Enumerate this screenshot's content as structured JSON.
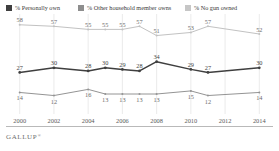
{
  "legend": {
    "items": [
      {
        "label": "% Personally own",
        "color": "#3f3f3f",
        "icon": "square-swatch-icon"
      },
      {
        "label": "% Other household member owns",
        "color": "#8e8e8e",
        "icon": "square-swatch-icon"
      },
      {
        "label": "% No gun owned",
        "color": "#c6c6c6",
        "icon": "square-swatch-icon"
      }
    ]
  },
  "footer": {
    "wordmark": "GALLUP",
    "trademark": "®"
  },
  "chart_data": {
    "type": "line",
    "title": "",
    "subtitle": "",
    "xlabel": "",
    "ylabel": "",
    "grid": true,
    "legend_position": "top",
    "x": [
      2000,
      2002,
      2004,
      2005,
      2006,
      2007,
      2008,
      2010,
      2011,
      2014
    ],
    "tick_labels": [
      "2000",
      "2002",
      "2004",
      "2006",
      "2008",
      "2010",
      "2012",
      "2014"
    ],
    "ticks": [
      2000,
      2002,
      2004,
      2006,
      2008,
      2010,
      2012,
      2014
    ],
    "xlim": [
      1999.2,
      2014.8
    ],
    "ylim": [
      0,
      65
    ],
    "series": [
      {
        "name": "% No gun owned",
        "color": "#c2c2c2",
        "values": [
          58,
          57,
          55,
          55,
          55,
          57,
          51,
          53,
          57,
          52
        ]
      },
      {
        "name": "% Personally own",
        "color": "#3f3f3f",
        "values": [
          27,
          30,
          28,
          30,
          29,
          28,
          34,
          29,
          27,
          30
        ]
      },
      {
        "name": "% Other household member owns",
        "color": "#949494",
        "values": [
          14,
          12,
          16,
          13,
          13,
          13,
          13,
          15,
          12,
          14
        ]
      }
    ]
  }
}
